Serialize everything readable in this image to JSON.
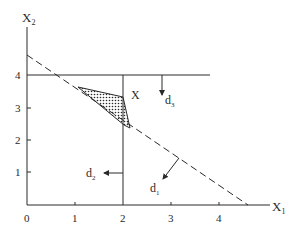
{
  "diagram": {
    "axes": {
      "x_label": "X",
      "x_sub": "1",
      "y_label": "X",
      "y_sub": "2",
      "origin_label": "0",
      "x_ticks": [
        "1",
        "2",
        "3",
        "4"
      ],
      "y_ticks": [
        "1",
        "2",
        "3",
        "4"
      ]
    },
    "labels": {
      "point": "X",
      "d3": "d",
      "d3_sub": "3",
      "d3_sup": "−",
      "d2": "d",
      "d2_sub": "2",
      "d2_sup": "−",
      "d1": "d",
      "d1_sub": "1",
      "d1_sup": "−"
    },
    "constraints": [
      {
        "name": "x2 = 4",
        "style": "solid"
      },
      {
        "name": "x1 = 2",
        "style": "solid"
      },
      {
        "name": "x1 + x2 ≈ 4.6",
        "style": "dashed"
      }
    ],
    "colors": {
      "ink": "#2a2a2a",
      "background": "#ffffff"
    }
  }
}
